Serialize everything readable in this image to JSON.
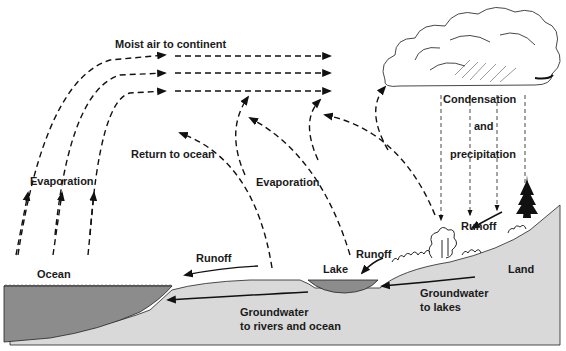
{
  "diagram": {
    "labels": {
      "moist_air": "Moist air to continent",
      "evaporation_ocean": "Evaporation",
      "return_to_ocean": "Return to ocean",
      "evaporation_land": "Evaporation",
      "condensation": "Condensation",
      "and": "and",
      "precipitation": "precipitation",
      "runoff_hill": "Runoff",
      "runoff_lake": "Runoff",
      "runoff_ocean": "Runoff",
      "ocean": "Ocean",
      "lake": "Lake",
      "land": "Land",
      "groundwater_lakes_1": "Groundwater",
      "groundwater_lakes_2": "to lakes",
      "groundwater_ocean_1": "Groundwater",
      "groundwater_ocean_2": "to rivers and ocean"
    },
    "colors": {
      "ocean_water": "#8c8c8c",
      "lake_water": "#8c8c8c",
      "land": "#d9d9d9",
      "line": "#111111"
    }
  }
}
